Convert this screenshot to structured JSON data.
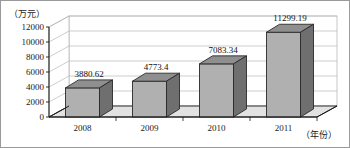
{
  "chart_data": {
    "type": "bar",
    "title": "",
    "subtitle": "",
    "xlabel": "（年份）",
    "ylabel": "（万元）",
    "categories": [
      "2008",
      "2009",
      "2010",
      "2011"
    ],
    "values": [
      3880.62,
      4773.4,
      7083.34,
      11299.19
    ],
    "value_labels": [
      "3880.62",
      "4773.4",
      "7083.34",
      "11299.19"
    ],
    "ytick_labels": [
      "0",
      "2000",
      "4000",
      "6000",
      "8000",
      "10000",
      "12000"
    ],
    "yticks": [
      0,
      2000,
      4000,
      6000,
      8000,
      10000,
      12000
    ],
    "ylim": [
      0,
      12000
    ],
    "grid": true,
    "legend": null,
    "style": {
      "bar_front_color": "#b0b0b0",
      "bar_top_color": "#8f8f8f",
      "bar_side_color": "#6f6f6f",
      "bar_edge_color": "#2a2a2a",
      "floor_color": "#e2e2e2",
      "wall_color": "#ffffff",
      "grid_color": "#b8b8b8",
      "axis_color": "#1a1a1a",
      "text_color": "#1a1a1a",
      "border_color": "#9a9a9a"
    }
  }
}
